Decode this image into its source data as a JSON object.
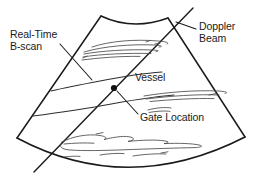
{
  "figure": {
    "background_color": "#ffffff",
    "ink_color": "#1a1a1a",
    "texture_color": "#4a4a4a",
    "width": 258,
    "height": 190
  },
  "labels": {
    "real_time_bscan": {
      "line1": "Real-Time",
      "line2": "B-scan",
      "name": "real-time-b-scan-label"
    },
    "doppler_beam": {
      "line1": "Doppler",
      "line2": "Beam",
      "name": "doppler-beam-label"
    },
    "vessel": {
      "text": "Vessel",
      "name": "vessel-label"
    },
    "gate_location": {
      "text": "Gate Location",
      "name": "gate-location-label"
    }
  },
  "markers": {
    "gate_point": {
      "x": 114,
      "y": 88,
      "radius": 3.1,
      "color": "#111111"
    }
  },
  "geometry": {
    "sector": {
      "top_left": [
        101,
        16
      ],
      "top_right": [
        168,
        18
      ],
      "bottom_left": [
        17,
        138
      ],
      "bottom_right": [
        245,
        137
      ],
      "bottom_arc_apex": [
        128,
        176
      ],
      "top_arc_dip": [
        133,
        25
      ]
    },
    "doppler_beam_line": {
      "start": [
        193,
        8
      ],
      "end": [
        34,
        172
      ]
    },
    "leaders": {
      "real_time_bscan": [
        [
          60,
          44
        ],
        [
          92,
          80
        ]
      ],
      "doppler_beam": [
        [
          196,
          29
        ],
        [
          176,
          22
        ]
      ],
      "gate_location": [
        [
          138,
          114
        ],
        [
          117,
          91
        ]
      ]
    }
  }
}
